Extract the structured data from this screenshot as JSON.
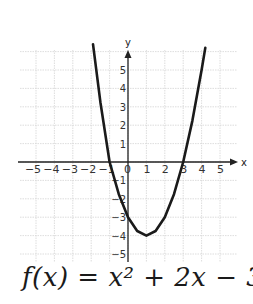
{
  "chart_data": {
    "type": "line",
    "title": "",
    "xlabel": "x",
    "ylabel": "y",
    "xlim": [
      -5.5,
      5.5
    ],
    "ylim": [
      -5.5,
      5.8
    ],
    "grid": true,
    "x_ticks": [
      -5,
      -4,
      -3,
      -2,
      -1,
      0,
      1,
      2,
      3,
      4,
      5
    ],
    "y_ticks": [
      -5,
      -4,
      -3,
      -2,
      -1,
      1,
      2,
      3,
      4,
      5
    ],
    "x_tick_labels": [
      "−5",
      "−4",
      "−3",
      "−2",
      "−1",
      "0",
      "1",
      "2",
      "3",
      "4",
      "5"
    ],
    "y_tick_labels": [
      "−5",
      "−4",
      "−3",
      "−2",
      "−1",
      "1",
      "2",
      "3",
      "4",
      "5"
    ],
    "series": [
      {
        "name": "f(x)",
        "points": [
          [
            -1.9,
            6.4
          ],
          [
            -1.5,
            3.25
          ],
          [
            -1,
            0
          ],
          [
            -0.5,
            -1.75
          ],
          [
            0,
            -3
          ],
          [
            0.5,
            -3.75
          ],
          [
            1,
            -4
          ],
          [
            1.5,
            -3.75
          ],
          [
            2,
            -3
          ],
          [
            2.5,
            -1.75
          ],
          [
            3,
            0
          ],
          [
            3.5,
            2.25
          ],
          [
            4,
            5
          ],
          [
            4.2,
            6.2
          ]
        ]
      }
    ],
    "annotations": [
      "f(x) = x² + 2x − 3"
    ]
  },
  "labels": {
    "x_axis": "x",
    "y_axis": "y",
    "equation": "f(x) = x² + 2x − 3"
  },
  "colors": {
    "curve": "#1a1a1a",
    "axis": "#222222",
    "grid": "#d4d4d4",
    "background": "#ffffff"
  }
}
